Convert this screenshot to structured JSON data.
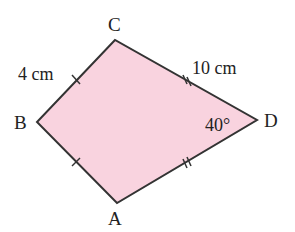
{
  "figure": {
    "type": "kite",
    "fill_color": "#f9d3df",
    "stroke_color": "#333333",
    "vertices": {
      "A": {
        "label": "A",
        "x": 117,
        "y": 203
      },
      "B": {
        "label": "B",
        "x": 37,
        "y": 122
      },
      "C": {
        "label": "C",
        "x": 115,
        "y": 40
      },
      "D": {
        "label": "D",
        "x": 257,
        "y": 120
      }
    },
    "side_labels": {
      "BC": "4 cm",
      "CD": "10 cm"
    },
    "angle_label": "40°"
  }
}
